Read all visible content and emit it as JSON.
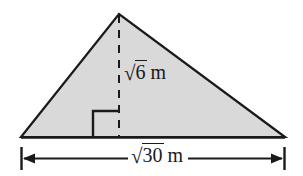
{
  "figure": {
    "kind": "geometry-diagram",
    "shape": "triangle",
    "colors": {
      "fill": "#d9d9d9",
      "stroke": "#1a1a1a",
      "background": "#ffffff",
      "text": "#1a1a1a"
    },
    "triangle": {
      "apex": {
        "x": 119,
        "y": 14
      },
      "left_vertex": {
        "x": 21,
        "y": 137
      },
      "right_vertex": {
        "x": 285,
        "y": 137
      }
    },
    "altitude": {
      "style": "dashed",
      "from": {
        "x": 119,
        "y": 14
      },
      "to": {
        "x": 119,
        "y": 137
      },
      "label_radical": "√",
      "label_radicand": "6",
      "label_unit": "m",
      "label_text": "√6 m"
    },
    "right_angle_marker": {
      "present": true,
      "size": 26,
      "corner": {
        "x": 119,
        "y": 137
      },
      "opens": "left"
    },
    "base_dimension": {
      "line_y": 158,
      "left_tick_x": 21,
      "right_tick_x": 285,
      "arrows": "both",
      "label_radical": "√",
      "label_radicand": "30",
      "label_unit": "m",
      "label_text": "√30 m"
    }
  }
}
